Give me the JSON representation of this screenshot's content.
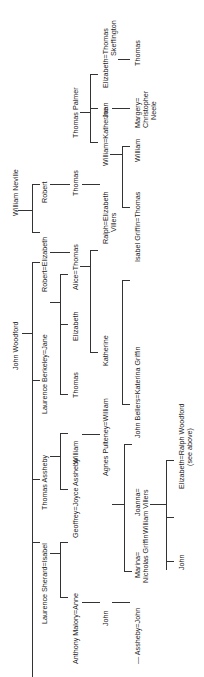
{
  "diagram": {
    "type": "family-tree",
    "orientation": "rotated-90-ccw",
    "people": {
      "john_woodford": "John Woodford",
      "william_neville": "William Neville",
      "thomas_palmer": "Thomas Palmer",
      "laurence_sherard_isabel": "Laurence Sherard=Isabel",
      "thomas_assheby": "Thomas Assheby",
      "laurence_berkeley_jane": "Laurence Berkeley=Jane",
      "robert_elizabeth": "Robert=Elizabeth",
      "robert": "Robert",
      "anthony_malory_anne": "Anthony Malory=Anne",
      "geoffrey_joyce": "Geoffrey=Joyce Assheby",
      "william_a": "William",
      "thomas_b": "Thomas",
      "elizabeth_b": "Elizabeth",
      "alice_thomas": "Alice=Thomas",
      "thomas_n": "Thomas",
      "william_katherine": "William=Katherine",
      "joan": "Joan",
      "elizabeth_skeffington_1": "Elizabeth=Thomas",
      "elizabeth_skeffington_2": "Skeffington",
      "assheby_john": "— Assheby=John",
      "john_m": "John",
      "agnes_pulteney": "Agnes Pulteney=William",
      "katherine": "Katherine",
      "ralph_villers_1": "Ralph=Elizabeth",
      "ralph_villers_2": "Villers",
      "marina_1": "Marina=",
      "marina_2": "Nicholas Griffin",
      "joanna_1": "Joanna=",
      "joanna_2": "William Villers",
      "john_bellers": "John Bellers=Katerina Griffin",
      "isabel_griffin": "Isabel Griffin=Thomas",
      "william_k": "William",
      "margery_1": "Margery=",
      "margery_2": "Christopher",
      "margery_3": "Neele",
      "thomas_sk": "Thomas",
      "john_j": "John",
      "elizabeth_ralph": "Elizabeth=Ralph Woodford",
      "see_above": "(see above)"
    }
  }
}
